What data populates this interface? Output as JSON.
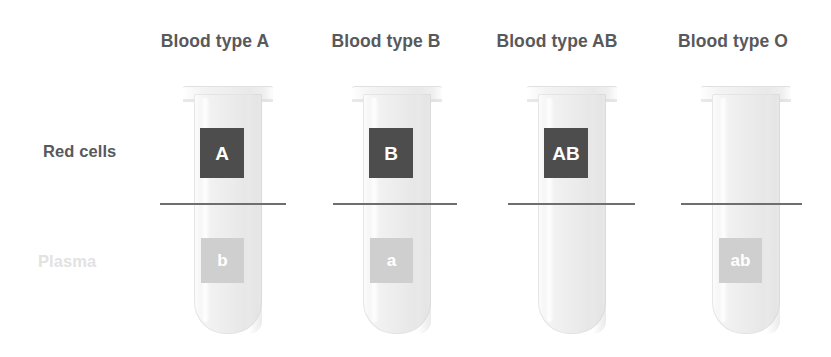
{
  "diagram": {
    "width": 831,
    "height": 357,
    "background_color": "#ffffff"
  },
  "row_labels": {
    "red_cells": "Red cells",
    "plasma": "Plasma",
    "red_cells_color": "#58595b",
    "plasma_color": "#e2e2e2"
  },
  "colors": {
    "title_text": "#58595b",
    "antigen_square": "#4d4d4d",
    "antibody_square": "#cfcfcf",
    "marker_text": "#ffffff",
    "separator_line": "#6d6e71",
    "tube_glass": "#ececec"
  },
  "columns": [
    {
      "title": "Blood type A",
      "title_center_x": 215,
      "tube_left": 194,
      "antigen": "A",
      "antigen_present": true,
      "antibody": "b",
      "antibody_present": true,
      "separator_left": 160,
      "separator_width": 126
    },
    {
      "title": "Blood type B",
      "title_center_x": 386,
      "tube_left": 363,
      "antigen": "B",
      "antigen_present": true,
      "antibody": "a",
      "antibody_present": true,
      "separator_left": 333,
      "separator_width": 124
    },
    {
      "title": "Blood type AB",
      "title_center_x": 557,
      "tube_left": 538,
      "antigen": "AB",
      "antigen_present": true,
      "antibody": "",
      "antibody_present": false,
      "separator_left": 508,
      "separator_width": 127
    },
    {
      "title": "Blood type O",
      "title_center_x": 733,
      "tube_left": 712,
      "antigen": "",
      "antigen_present": false,
      "antibody": "ab",
      "antibody_present": true,
      "separator_left": 681,
      "separator_width": 121
    }
  ]
}
